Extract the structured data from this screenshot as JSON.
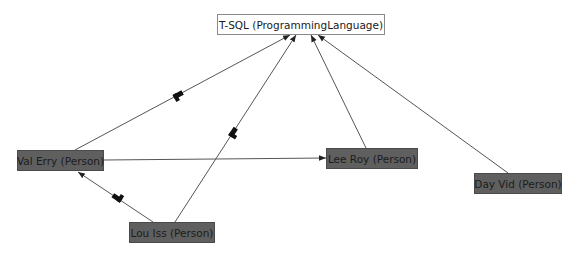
{
  "diagram": {
    "nodes": [
      {
        "id": "tsql",
        "label": "T-SQL (ProgrammingLanguage)",
        "kind": "lang"
      },
      {
        "id": "val",
        "label": "Val Erry (Person)",
        "kind": "person"
      },
      {
        "id": "lee",
        "label": "Lee Roy (Person)",
        "kind": "person"
      },
      {
        "id": "day",
        "label": "Day Vid (Person)",
        "kind": "person"
      },
      {
        "id": "lou",
        "label": "Lou Iss (Person)",
        "kind": "person"
      }
    ],
    "edges": [
      {
        "from": "val",
        "to": "tsql",
        "marker": true
      },
      {
        "from": "lou",
        "to": "tsql",
        "marker": true
      },
      {
        "from": "lee",
        "to": "tsql",
        "marker": false
      },
      {
        "from": "day",
        "to": "tsql",
        "marker": false
      },
      {
        "from": "val",
        "to": "lee",
        "marker": false
      },
      {
        "from": "lou",
        "to": "val",
        "marker": true
      }
    ],
    "colors": {
      "person_fill": "#5f5f5f",
      "lang_fill": "#ffffff",
      "edge": "#555555",
      "marker": "#111111"
    }
  }
}
